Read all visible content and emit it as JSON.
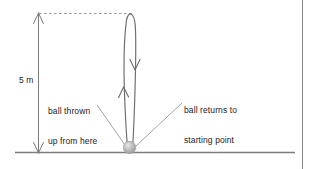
{
  "diagram": {
    "height_label": "5 m",
    "annotations": {
      "left_label_line1": "ball thrown",
      "left_label_line2": "up from here",
      "right_label_line1": "ball returns to",
      "right_label_line2": "starting point"
    },
    "elements": {
      "ground_line_name": "ground-line",
      "ball_name": "ball",
      "trajectory_name": "trajectory-loop",
      "dimension_name": "height-dimension-arrow",
      "dashed_name": "apex-dashed-guide"
    },
    "colors": {
      "stroke": "#6e6e6e",
      "dark_stroke": "#555555",
      "text": "#1a1a1a",
      "ball_fill": "#b9b9b9",
      "ball_highlight": "#e2e2e2",
      "border": "#8a8a8a",
      "background": "#ffffff"
    },
    "geometry": {
      "height_meters": 5,
      "ground_y": 152,
      "apex_y": 14,
      "ball_x": 129,
      "ball_y": 148,
      "dimension_x": 38
    }
  }
}
